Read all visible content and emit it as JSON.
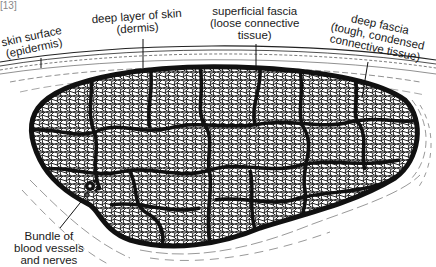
{
  "figure": {
    "type": "anatomical cross-section of a muscle",
    "corner_label": "[13]"
  },
  "labels": {
    "skin_surface": {
      "line1": "skin surface",
      "line2": "(epidermis)"
    },
    "dermis": {
      "line1": "deep layer of skin",
      "line2": "(dermis)"
    },
    "superficial_fascia": {
      "line1": "superficial fascia",
      "line2": "(loose connective",
      "line3": "tissue)"
    },
    "deep_fascia": {
      "line1": "deep fascia",
      "line2": "(tough, condensed",
      "line3": "connective tissue)"
    },
    "bundle": {
      "line1": "Bundle of",
      "line2": "blood vessels",
      "line3": "and nerves"
    }
  },
  "colors": {
    "ink": "#111111",
    "background": "#ffffff"
  }
}
